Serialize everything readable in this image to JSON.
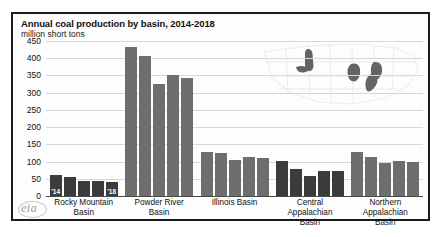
{
  "header": {
    "title": "Annual coal production by basin, 2014-2018",
    "subtitle": "million short tons"
  },
  "branding": {
    "logo_text": "eia"
  },
  "axis": {
    "y_ticks": [
      "450",
      "400",
      "350",
      "300",
      "250",
      "200",
      "150",
      "100",
      "50",
      "0"
    ]
  },
  "chart_data": {
    "type": "bar",
    "title": "Annual coal production by basin, 2014-2018",
    "subtitle": "million short tons",
    "xlabel": "",
    "ylabel": "million short tons",
    "ylim": [
      0,
      450
    ],
    "ytick_step": 50,
    "grid": true,
    "legend": "none",
    "series_labels_shown_on_bars": [
      "'14",
      "'18"
    ],
    "x": [
      "2014",
      "2015",
      "2016",
      "2017",
      "2018"
    ],
    "categories": [
      "Rocky Mountain Basin",
      "Powder River Basin",
      "Illinois Basin",
      "Central Appalachian Basin",
      "Northern Appalachian Basin"
    ],
    "series": [
      {
        "name": "Rocky Mountain Basin",
        "values": [
          62,
          56,
          44,
          45,
          42
        ]
      },
      {
        "name": "Powder River Basin",
        "values": [
          434,
          407,
          325,
          350,
          342
        ]
      },
      {
        "name": "Illinois Basin",
        "values": [
          128,
          125,
          105,
          112,
          110
        ]
      },
      {
        "name": "Central Appalachian Basin",
        "values": [
          103,
          79,
          58,
          72,
          73
        ]
      },
      {
        "name": "Northern Appalachian Basin",
        "values": [
          127,
          113,
          96,
          101,
          99
        ]
      }
    ],
    "annotations": [
      {
        "text": "'14",
        "on": "Rocky Mountain Basin 2014 bar"
      },
      {
        "text": "'18",
        "on": "Rocky Mountain Basin 2018 bar"
      }
    ],
    "inset": {
      "type": "map",
      "description": "United States outline with coal basin regions shaded"
    }
  },
  "category_lines": [
    [
      "Rocky Mountain",
      "Basin"
    ],
    [
      "Powder River",
      "Basin"
    ],
    [
      "Illinois Basin",
      ""
    ],
    [
      "Central",
      "Appalachian",
      "Basin"
    ],
    [
      "Northern",
      "Appalachian",
      "Basin"
    ]
  ]
}
